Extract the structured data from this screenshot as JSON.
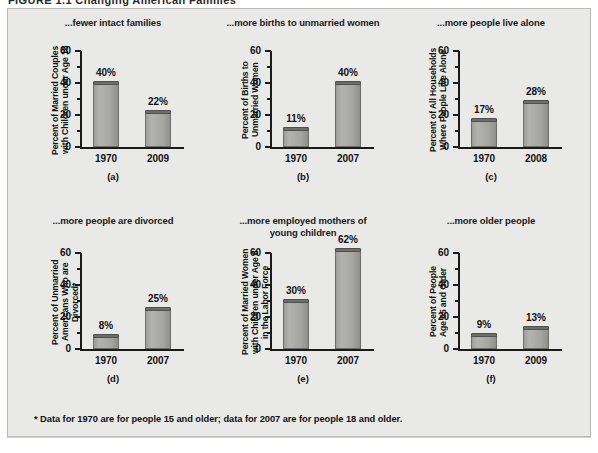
{
  "figure": {
    "title": "FIGURE  1.1    Changing American Families",
    "footnote": "* Data for 1970 are for people 15 and older; data for 2007 are for people 18 and older.",
    "background_color": "#e9e9e7",
    "bar_color": "#a8a8a5",
    "bar_cap_color": "#6d6d6a",
    "axis_color": "#1a1a1a"
  },
  "chart_data": [
    {
      "type": "bar",
      "panel": "(a)",
      "title": "...fewer intact families",
      "ylabel": "Percent of Married Couples\nwith Children under Age 18",
      "xlabel": "",
      "categories": [
        "1970",
        "2009"
      ],
      "values": [
        40,
        22
      ],
      "value_labels": [
        "40%",
        "22%"
      ],
      "ylim": [
        0,
        60
      ],
      "yticks": [
        0,
        20,
        40,
        60
      ],
      "ytick_labels": [
        "0",
        "20",
        "40",
        "60"
      ],
      "minor_yticks": [
        10,
        30,
        50
      ],
      "grid": false,
      "legend": "none"
    },
    {
      "type": "bar",
      "panel": "(b)",
      "title": "...more births to unmarried women",
      "ylabel": "Percent of Births to\nUnmarried Women",
      "xlabel": "",
      "categories": [
        "1970",
        "2007"
      ],
      "values": [
        11,
        40
      ],
      "value_labels": [
        "11%",
        "40%"
      ],
      "ylim": [
        0,
        60
      ],
      "yticks": [
        0,
        20,
        40,
        60
      ],
      "ytick_labels": [
        "0",
        "20",
        "40",
        "60"
      ],
      "minor_yticks": [
        10,
        30,
        50
      ],
      "grid": false,
      "legend": "none"
    },
    {
      "type": "bar",
      "panel": "(c)",
      "title": "...more people live alone",
      "ylabel": "Percent of All Households\nWhere People Live Alone",
      "xlabel": "",
      "categories": [
        "1970",
        "2008"
      ],
      "values": [
        17,
        28
      ],
      "value_labels": [
        "17%",
        "28%"
      ],
      "ylim": [
        0,
        60
      ],
      "yticks": [
        0,
        20,
        40,
        60
      ],
      "ytick_labels": [
        "0",
        "20",
        "40",
        "60"
      ],
      "minor_yticks": [
        10,
        30,
        50
      ],
      "grid": false,
      "legend": "none"
    },
    {
      "type": "bar",
      "panel": "(d)",
      "title": "...more people are divorced",
      "ylabel": "Percent of Unmarried\nAmericans Who are Divorced*",
      "xlabel": "",
      "categories": [
        "1970",
        "2007"
      ],
      "values": [
        8,
        25
      ],
      "value_labels": [
        "8%",
        "25%"
      ],
      "ylim": [
        0,
        60
      ],
      "yticks": [
        0,
        20,
        40,
        60
      ],
      "ytick_labels": [
        "0",
        "20",
        "40",
        "60"
      ],
      "minor_yticks": [
        10,
        30,
        50
      ],
      "grid": false,
      "legend": "none"
    },
    {
      "type": "bar",
      "panel": "(e)",
      "title": "...more employed mothers of\nyoung children",
      "ylabel": "Percent of Married Women\nwith Children under Age 6\nin the Labor Force",
      "xlabel": "",
      "categories": [
        "1970",
        "2007"
      ],
      "values": [
        30,
        62
      ],
      "value_labels": [
        "30%",
        "62%"
      ],
      "ylim": [
        0,
        60
      ],
      "yticks": [
        0,
        20,
        40,
        60
      ],
      "ytick_labels": [
        "0",
        "20",
        "40",
        "60"
      ],
      "minor_yticks": [
        10,
        30,
        50
      ],
      "grid": false,
      "legend": "none"
    },
    {
      "type": "bar",
      "panel": "(f)",
      "title": "...more older people",
      "ylabel": "Percent of People\nAge 65 and Older",
      "xlabel": "",
      "categories": [
        "1970",
        "2009"
      ],
      "values": [
        9,
        13
      ],
      "value_labels": [
        "9%",
        "13%"
      ],
      "ylim": [
        0,
        60
      ],
      "yticks": [
        0,
        20,
        40,
        60
      ],
      "ytick_labels": [
        "0",
        "20",
        "40",
        "60"
      ],
      "minor_yticks": [
        10,
        30,
        50
      ],
      "grid": false,
      "legend": "none"
    }
  ]
}
